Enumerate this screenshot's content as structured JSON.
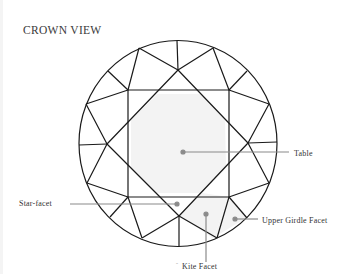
{
  "title": "CROWN VIEW",
  "diagram": {
    "colors": {
      "outline": "#1a1a1a",
      "highlight_fill": "#f3f3f3",
      "leader_line": "#8a8a8a",
      "leader_dot": "#8a8a8a"
    },
    "labels": {
      "table": "Table",
      "star_facet": "Star-facet",
      "upper_girdle_facet": "Upper Girdle Facet",
      "kite_facet": "Kite Facet",
      "kite_tick": "˜"
    }
  }
}
